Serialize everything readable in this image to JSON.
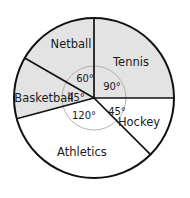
{
  "chart_data": {
    "type": "pie",
    "title": "",
    "subtitle": "",
    "xlabel": "",
    "ylabel": "",
    "legend_position": "none",
    "grid": false,
    "units": "degrees",
    "total_degrees": 360,
    "categories": [
      "Tennis",
      "Hockey",
      "Athletics",
      "Basketball",
      "Netball"
    ],
    "values": [
      90,
      45,
      120,
      45,
      60
    ],
    "angle_labels": [
      "90°",
      "45°",
      "120°",
      "45°",
      "60°"
    ],
    "slices": [
      {
        "label": "Tennis",
        "angle": 90,
        "angle_label": "90°",
        "start_deg": 0,
        "end_deg": 90,
        "shaded": true,
        "fill": "#e3e3e3",
        "label_x": 131,
        "label_y": 62,
        "angle_label_x": 112,
        "angle_label_y": 87
      },
      {
        "label": "Hockey",
        "angle": 45,
        "angle_label": "45°",
        "start_deg": 90,
        "end_deg": 135,
        "shaded": false,
        "fill": "#ffffff",
        "label_x": 139,
        "label_y": 122,
        "angle_label_x": 117,
        "angle_label_y": 112
      },
      {
        "label": "Athletics",
        "angle": 120,
        "angle_label": "120°",
        "start_deg": 135,
        "end_deg": 255,
        "shaded": false,
        "fill": "#ffffff",
        "label_x": 82,
        "label_y": 152,
        "angle_label_x": 84,
        "angle_label_y": 116
      },
      {
        "label": "Basketball",
        "angle": 45,
        "angle_label": "45°",
        "start_deg": 255,
        "end_deg": 300,
        "shaded": true,
        "fill": "#e3e3e3",
        "label_x": 44,
        "label_y": 98,
        "angle_label_x": 76,
        "angle_label_y": 98
      },
      {
        "label": "Netball",
        "angle": 60,
        "angle_label": "60°",
        "start_deg": 300,
        "end_deg": 360,
        "shaded": true,
        "fill": "#e3e3e3",
        "label_x": 71,
        "label_y": 44,
        "angle_label_x": 85,
        "angle_label_y": 79
      }
    ],
    "geometry": {
      "center_x": 94,
      "center_y": 98,
      "radius": 80,
      "inner_arc_radius": 32
    },
    "colors": {
      "shaded_fill": "#e3e3e3",
      "unshaded_fill": "#ffffff",
      "outline": "#111111",
      "inner_arc": "#aaaaaa",
      "text": "#1a1a1a",
      "background": "#ffffff"
    }
  }
}
